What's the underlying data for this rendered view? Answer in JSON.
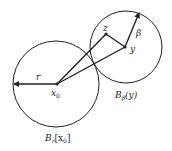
{
  "diagram": {
    "title": "",
    "labels": {
      "r": "r",
      "x0": "x",
      "x0_sub": "0",
      "z": "z",
      "y": "y",
      "beta": "β",
      "ball_small": "B",
      "ball_small_sub": "β",
      "ball_small_arg": "(y)",
      "ball_big": "B",
      "ball_big_sub": "r",
      "ball_big_arg_open": "[x",
      "ball_big_arg_sub": "0",
      "ball_big_arg_close": "]"
    },
    "colors": {
      "stroke": "#222222",
      "background": "#ffffff"
    }
  }
}
